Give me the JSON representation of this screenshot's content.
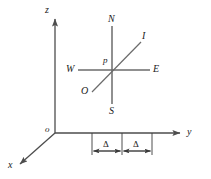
{
  "figure": {
    "type": "3d-coordinate-diagram-with-compass",
    "background_color": "#ffffff",
    "line_color": "#4d4d4d",
    "text_color": "#1a1a1a",
    "width": 211,
    "height": 179
  },
  "axes": {
    "origin_label": "o",
    "z_label": "z",
    "y_label": "y",
    "x_label": "x"
  },
  "compass": {
    "north_label": "N",
    "south_label": "S",
    "west_label": "W",
    "east_label": "E",
    "center_label": "p",
    "inner_label": "I",
    "outer_label": "O"
  },
  "measurements": {
    "first_label": "Δ",
    "second_label": "Δ"
  }
}
